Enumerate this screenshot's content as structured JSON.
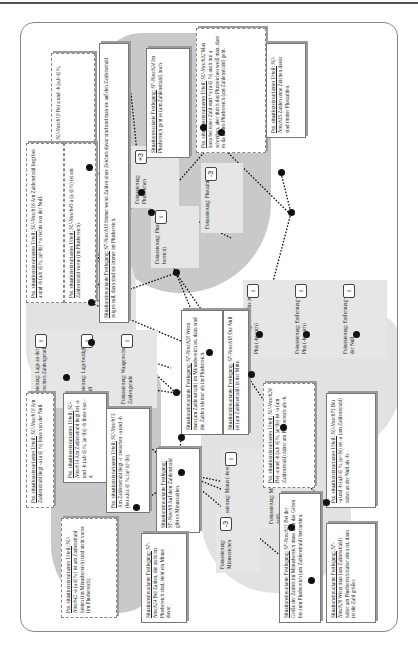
{
  "focus_nodes": [
    {
      "id": "lage-waagerechte",
      "label": "Fokussierung: Lage an der waagerechten Zahlengerade",
      "badge": "↕"
    },
    {
      "id": "lage-null",
      "label": "Fokussierung: Lage bezüglich der Null",
      "badge": "↕"
    },
    {
      "id": "waagerechte",
      "label": "Fokussierung: Waagerechte Zahlengerade",
      "badge": "↕"
    },
    {
      "id": "pluszeichen",
      "label": "Fokussierung: Pluszeichen",
      "badge": "+3"
    },
    {
      "id": "plus-bereich",
      "label": "Fokussierung: Plus (-bereich)",
      "badge": "↕"
    },
    {
      "id": "pluszahl",
      "label": "Fokussierung: Pluszahl",
      "badge": "-3"
    },
    {
      "id": "gehen-bis-plus",
      "label": "Fokussierung: Gehen bis zum Plus (-bereich)",
      "badge": "↕"
    },
    {
      "id": "entfernung-plus",
      "label": "Fokussierung: Entfernung vom Plus (-bereich)",
      "badge": "↕"
    },
    {
      "id": "entfernung-null",
      "label": "Fokussierung: Entfernung von der Null",
      "badge": "↕"
    },
    {
      "id": "minus-bereich",
      "label": "Fokussierung: Minus (-bereich)",
      "badge": "↕"
    },
    {
      "id": "minus-zahl",
      "label": "Fokussierung: Minus (-zahl)",
      "badge": "-3"
    },
    {
      "id": "minuszeichen",
      "label": "Fokussierung: Minuszeichen",
      "badge": "-3"
    }
  ],
  "boxes": [
    {
      "title": "Pot. situationsinvariantes Urteil:",
      "ref": "SU-Nosch18",
      "text": "Bei a und -b (a,b ∈ ℕ, |a|=|b|) ist +a im Plusbereich."
    },
    {
      "title": "Situationsinvariante Festlegung:",
      "ref": "SF-Nosch33",
      "text": "Immer wenn Zahlen ohne Zeichen davor sind und man sie auf den Zahlenstrahl zeigen soll, dann sind sie immer im Plusbereich."
    },
    {
      "title": "Situationsvariante Festlegung:",
      "ref": "SF-Nosch24",
      "text": "Im Plusbereich geht es (am Zahlenstrahl) hoch."
    },
    {
      "title": "Pot. situationsinvariantes Urteil:",
      "ref": "SU-Nosch32",
      "text": "Man kann bei einer Zahl statt +a (a ∈ ℕ) auch nur a schreiben, aber durch das Pluszeichen weiß man, dass es da in den Plusbereich (am Zahlenstrahl) geht."
    },
    {
      "title": "Pot. situationsinvariantes Urteil:",
      "ref": "SU-Nosch35",
      "text": "Zahlen ohne Zeichen davor sind immer Pluszahlen."
    },
    {
      "title": "Pot. situationsinvariantes Urteil:",
      "ref": "SU-Nosch16",
      "text": "Am Zahlenstrahl liegt bei a und -b (a,b ∈ ℕ, |a|=|b|) +a rechts von der Null."
    },
    {
      "title": "Pot. situationsinvariantes Urteil:",
      "ref": "SU-Nosch45",
      "text": "a (a ∈ ℕ) ist am Zahlenstrahl vorne (im Plusbereich)."
    },
    {
      "title": "Situationsinvariante Festlegung:",
      "ref": "SF-Nosch28",
      "text": "Wenn man (am Zahlenstrahl) im Minusbereich ist, dann sind die Zahlen kleiner als im Plusbereich."
    },
    {
      "title": "Situationsinvariante Festlegung:",
      "ref": "SF-Nosch38",
      "text": "Die Null ist (am Zahlenstrahl) in der Mitte."
    },
    {
      "title": "Pot. situationsinvariantes Urteil:",
      "ref": "SU-Nosch18",
      "text": "Am Zahlenstrahl liegt -a (a ∈ ℕ) links von der Null."
    },
    {
      "title": "Pot. situationsinvariantes Urteil:",
      "ref": "SU-Nosch14",
      "text": "Am Zahlenstrahl liegt bei -a und -b (a,b ∈ ℕ, |a|<|b|) -b links von -a."
    },
    {
      "title": "Pot. situationsinvariantes Urteil:",
      "ref": "SU-Nosch15",
      "text": "Am Zahlenstrahl liegt -c zwischen -a und -b (bei a,b,c ∈ ℕ, |a|<|c|<|b|)."
    },
    {
      "title": "Pot. situationsinvariantes Urteil:",
      "ref": "SU-Nosch42",
      "text": "-a (a ∈ ℕ) ist am Zahlenstrahl hinten (im Minusbereich) und nicht vorne (im Plusbereich)."
    },
    {
      "title": "Situationsinvariante Festlegung:",
      "ref": "SF-Nosch9",
      "text": "Auf dem Zahlenstrahl gibt es Minuszahlen."
    },
    {
      "title": "Situationsinvariante Festlegung:",
      "ref": "SF-Nosch24",
      "text": "Bei Zahlen, die nicht im Plusbereich sind, steht ein Minus davor."
    },
    {
      "title": "Pot. situationsinvariantes Urteil:",
      "ref": "SU-Nosch26",
      "text": "Bei -a und -b (a,b ∈ ℕ, |a|<|b|) ist -a (am Zahlenstrahl) näher am Plusbereich als -b."
    },
    {
      "title": "Pot. situationsinvariantes Urteil:",
      "ref": "SU-Nosch75",
      "text": "Bei -a und -b (a,b ∈ ℕ, |a|<|b|) ist -a (am Zahlenstrahl) näher an der Null als -b."
    },
    {
      "title": "Situationsinvariante Festlegung:",
      "ref": "SF-Nosch21",
      "text": "Bei der Größe der Zahlen im Minusbereich muss man das Gehen bis zum Plusbereich (am Zahlenstrahl) betrachten."
    },
    {
      "title": "Situationsinvariante Festlegung:",
      "ref": "SF-Nosch29",
      "text": "Wenn man (am Zahlenstrahl) näher am Plusbereich/näher oben ist, dann ist die Zahl größer."
    }
  ],
  "colors": {
    "blob": "#c9c9c9",
    "node": "#e6e6e6",
    "box_border": "#777777",
    "dot": "#111111"
  }
}
